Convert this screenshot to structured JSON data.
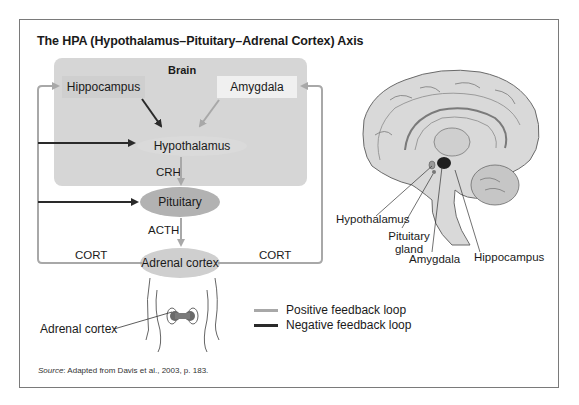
{
  "figure": {
    "title": "The HPA (Hypothalamus–Pituitary–Adrenal Cortex) Axis",
    "source_prefix": "Source",
    "source_text": ": Adapted from Davis et al., 2003, p. 183."
  },
  "diagram": {
    "panel_label": "Brain",
    "nodes": {
      "hippocampus": "Hippocampus",
      "amygdala": "Amygdala",
      "hypothalamus": "Hypothalamus",
      "pituitary": "Pituitary",
      "adrenal_cortex": "Adrenal cortex"
    },
    "edge_labels": {
      "crh": "CRH",
      "acth": "ACTH",
      "cort_left": "CORT",
      "cort_right": "CORT"
    },
    "body_label": "Adrenal cortex",
    "colors": {
      "positive": "#a8a8a8",
      "negative": "#2a2a2a",
      "panel": "#d6d6d6"
    }
  },
  "brain_illustration": {
    "labels": {
      "hypothalamus": "Hypothalamus",
      "pituitary_line1": "Pituitary",
      "pituitary_line2": "gland",
      "amygdala": "Amygdala",
      "hippocampus": "Hippocampus"
    }
  },
  "legend": {
    "items": [
      {
        "label": "Positive feedback loop",
        "color": "#a8a8a8"
      },
      {
        "label": "Negative feedback loop",
        "color": "#2a2a2a"
      }
    ]
  }
}
